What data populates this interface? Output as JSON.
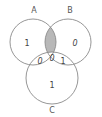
{
  "diagram": {
    "type": "venn-3",
    "colors": {
      "stroke": "#8a8a8a",
      "shaded": "#b8b8b8",
      "background": "#ffffff",
      "text": "#444444"
    },
    "sets": [
      {
        "id": "A",
        "label": "A"
      },
      {
        "id": "B",
        "label": "B"
      },
      {
        "id": "C",
        "label": "C"
      }
    ],
    "regions": {
      "A_only": "1",
      "B_only": "0",
      "C_only": "1",
      "A_and_B_only": "",
      "A_and_C_only": "0",
      "B_and_C_only": "1",
      "A_and_B_and_C": "0"
    },
    "shaded_region": "A_and_B_only"
  }
}
